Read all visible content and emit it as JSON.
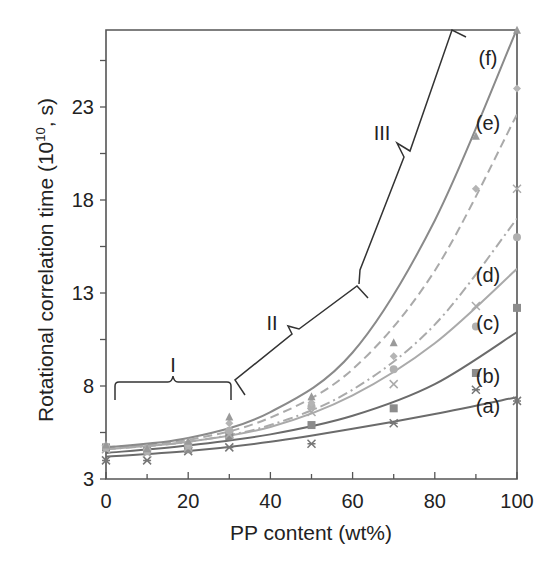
{
  "chart_data": {
    "type": "scatter",
    "title": "",
    "xlabel": "PP content (wt%)",
    "ylabel": "Rotational correlation time (10^10, s)",
    "ylabel_parts": {
      "main": "Rotational correlation time (10",
      "sup": "10",
      "tail": ", s)"
    },
    "xlim": [
      0,
      100
    ],
    "ylim": [
      3,
      27.2
    ],
    "xticks": [
      0,
      20,
      40,
      60,
      80,
      100
    ],
    "xtick_labels": [
      "0",
      "20",
      "40",
      "60",
      "80",
      "100"
    ],
    "yticks": [
      3,
      8,
      13,
      18,
      23
    ],
    "ytick_labels": [
      "3",
      "8",
      "13",
      "18",
      "23"
    ],
    "grid": false,
    "legend": "inline curve labels (a)-(f)",
    "x": [
      0,
      10,
      20,
      30,
      50,
      70,
      90,
      100
    ],
    "series": [
      {
        "name": "(a)",
        "marker": "x-star",
        "line": "solid",
        "color": "#6b6b6b",
        "values": [
          4.0,
          4.0,
          4.5,
          4.7,
          4.9,
          6.0,
          7.8,
          7.2
        ],
        "fit": [
          [
            0,
            4.2
          ],
          [
            20,
            4.5
          ],
          [
            40,
            5.0
          ],
          [
            60,
            5.7
          ],
          [
            80,
            6.5
          ],
          [
            100,
            7.4
          ]
        ]
      },
      {
        "name": "(b)",
        "marker": "square",
        "line": "solid",
        "color": "#6b6b6b",
        "values": [
          4.7,
          4.5,
          4.6,
          5.3,
          5.9,
          6.8,
          8.7,
          12.2
        ],
        "fit": [
          [
            0,
            4.4
          ],
          [
            20,
            4.8
          ],
          [
            40,
            5.4
          ],
          [
            60,
            6.4
          ],
          [
            80,
            8.1
          ],
          [
            100,
            10.9
          ]
        ]
      },
      {
        "name": "(c)",
        "marker": "cross",
        "line": "solid",
        "color": "#aaaaaa",
        "values": [
          4.6,
          4.4,
          4.7,
          5.4,
          6.6,
          8.1,
          12.3,
          18.6
        ],
        "fit": [
          [
            0,
            4.6
          ],
          [
            20,
            5.0
          ],
          [
            40,
            5.8
          ],
          [
            60,
            7.5
          ],
          [
            80,
            10.3
          ],
          [
            100,
            14.3
          ]
        ]
      },
      {
        "name": "(d)",
        "marker": "circle",
        "line": "dashdot",
        "color": "#aaaaaa",
        "values": [
          4.7,
          4.5,
          4.8,
          5.6,
          6.9,
          8.9,
          11.2,
          16.0
        ],
        "fit": [
          [
            0,
            4.6
          ],
          [
            20,
            5.0
          ],
          [
            40,
            5.9
          ],
          [
            60,
            7.8
          ],
          [
            80,
            11.3
          ],
          [
            100,
            17.0
          ]
        ]
      },
      {
        "name": "(e)",
        "marker": "diamond",
        "line": "dashed",
        "color": "#aaaaaa",
        "values": [
          4.8,
          4.6,
          4.9,
          6.0,
          7.1,
          9.6,
          18.6,
          24.0
        ],
        "fit": [
          [
            0,
            4.7
          ],
          [
            20,
            5.1
          ],
          [
            40,
            6.3
          ],
          [
            60,
            8.9
          ],
          [
            80,
            14.2
          ],
          [
            100,
            22.6
          ]
        ]
      },
      {
        "name": "(f)",
        "marker": "triangle",
        "line": "solid",
        "color": "#8a8a8a",
        "values": [
          4.8,
          4.6,
          5.0,
          6.3,
          7.4,
          10.3,
          21.4,
          27.1
        ],
        "fit": [
          [
            0,
            4.7
          ],
          [
            20,
            5.2
          ],
          [
            40,
            6.6
          ],
          [
            60,
            9.8
          ],
          [
            80,
            16.9
          ],
          [
            100,
            27.2
          ]
        ]
      }
    ],
    "annotations": [
      {
        "label": "I",
        "type": "brace",
        "x_range": [
          2,
          31
        ],
        "y": 7.3
      },
      {
        "label": "II",
        "type": "brace",
        "x_range": [
          31,
          62
        ],
        "y_range": [
          6.5,
          13.2
        ]
      },
      {
        "label": "III",
        "type": "brace",
        "x_range": [
          63,
          91
        ],
        "y_range": [
          13.2,
          27.2
        ]
      }
    ]
  },
  "labels": {
    "x_axis": "PP content (wt%)",
    "y_axis_main": "Rotational correlation time (10",
    "y_axis_sup": "10",
    "y_axis_tail": ", s)",
    "curves": [
      "(a)",
      "(b)",
      "(c)",
      "(d)",
      "(e)",
      "(f)"
    ],
    "regions": [
      "I",
      "II",
      "III"
    ]
  }
}
